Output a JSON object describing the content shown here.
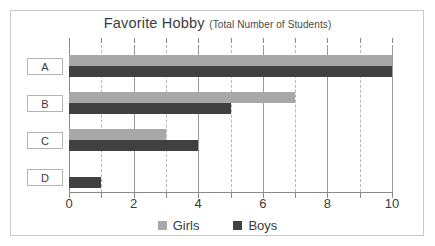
{
  "chart_data": {
    "type": "bar",
    "orientation": "horizontal",
    "title": "Favorite Hobby",
    "subtitle": "(Total Number of Students)",
    "xlabel": "",
    "ylabel": "",
    "categories": [
      "A",
      "B",
      "C",
      "D"
    ],
    "series": [
      {
        "name": "Girls",
        "color": "#a8a8a8",
        "values": [
          10,
          7,
          3,
          0
        ]
      },
      {
        "name": "Boys",
        "color": "#404040",
        "values": [
          10,
          5,
          4,
          1
        ]
      }
    ],
    "xlim": [
      0,
      10
    ],
    "xticks": [
      0,
      2,
      4,
      6,
      8,
      10
    ],
    "xtick_labels": [
      "0",
      "2",
      "4",
      "6",
      "8",
      "10"
    ],
    "minor_gridlines": [
      1,
      3,
      5,
      7,
      9
    ],
    "major_gridlines": [
      2,
      4,
      6,
      8
    ],
    "grid": true,
    "legend_position": "bottom",
    "legend": [
      "Girls",
      "Boys"
    ]
  }
}
